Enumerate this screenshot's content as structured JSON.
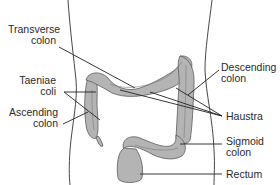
{
  "diagram": {
    "labels": {
      "transverse_colon": {
        "line1": "Transverse",
        "line2": "colon"
      },
      "taeniae_coli": {
        "line1": "Taeniae",
        "line2": "coli"
      },
      "ascending_colon": {
        "line1": "Ascending",
        "line2": "colon"
      },
      "descending_colon": {
        "line1": "Descending",
        "line2": "colon"
      },
      "haustra": {
        "line1": "Haustra"
      },
      "sigmoid_colon": {
        "line1": "Sigmoid",
        "line2": "colon"
      },
      "rectum": {
        "line1": "Rectum"
      }
    },
    "colors": {
      "organ_fill": "#b4b4b4",
      "organ_stroke": "#5a5a5a",
      "line": "#222222",
      "text": "#2a2a2a",
      "background": "#ffffff"
    }
  }
}
